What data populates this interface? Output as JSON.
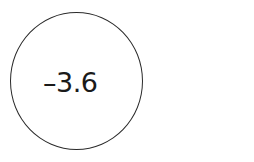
{
  "diagram": {
    "node": {
      "shape": "circle",
      "label": "–3.6",
      "stroke_color": "#2a2a2a",
      "text_color": "#1a1a1a",
      "fill_color": "#ffffff"
    }
  }
}
